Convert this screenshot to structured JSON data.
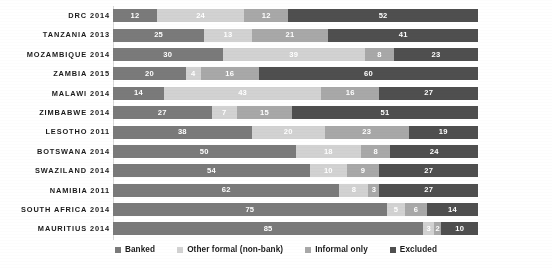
{
  "chart_data": {
    "type": "bar",
    "orientation": "horizontal",
    "stacked": true,
    "normalized_percent": true,
    "title": "",
    "subtitle": "",
    "xlabel": "",
    "ylabel": "",
    "xlim": [
      0,
      100
    ],
    "grid": false,
    "legend_position": "bottom",
    "categories": [
      "DRC 2014",
      "TANZANIA 2013",
      "MOZAMBIQUE 2014",
      "ZAMBIA 2015",
      "MALAWI 2014",
      "ZIMBABWE 2014",
      "LESOTHO 2011",
      "BOTSWANA 2014",
      "SWAZILAND 2014",
      "NAMIBIA 2011",
      "SOUTH AFRICA 2014",
      "MAURITIUS 2014"
    ],
    "series": [
      {
        "name": "Banked",
        "color": "#7a7a7a",
        "values": [
          12,
          25,
          30,
          20,
          14,
          27,
          38,
          50,
          54,
          62,
          75,
          85
        ]
      },
      {
        "name": "Other formal (non-bank)",
        "color": "#d2d2d2",
        "values": [
          24,
          13,
          39,
          4,
          43,
          7,
          20,
          18,
          10,
          8,
          5,
          3
        ]
      },
      {
        "name": "Informal only",
        "color": "#a8a8a8",
        "values": [
          12,
          21,
          8,
          16,
          16,
          15,
          23,
          8,
          9,
          3,
          6,
          2
        ]
      },
      {
        "name": "Excluded",
        "color": "#4f4f4f",
        "values": [
          52,
          41,
          23,
          60,
          27,
          51,
          19,
          24,
          27,
          27,
          14,
          10
        ]
      }
    ]
  },
  "legend": {
    "items": [
      {
        "label": "Banked",
        "color": "#7a7a7a"
      },
      {
        "label": "Other formal (non-bank)",
        "color": "#d2d2d2"
      },
      {
        "label": "Informal only",
        "color": "#a8a8a8"
      },
      {
        "label": "Excluded",
        "color": "#4f4f4f"
      }
    ]
  }
}
